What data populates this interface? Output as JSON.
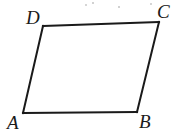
{
  "figure": {
    "background_color": "#ffffff",
    "ink_color": "#1a1a1a",
    "stroke_width": 2,
    "width": 176,
    "height": 138,
    "shape_type": "parallelogram",
    "labels": {
      "A": "A",
      "B": "B",
      "C": "C",
      "D": "D"
    },
    "vertices": [
      {
        "name": "A",
        "x": 23,
        "y": 113
      },
      {
        "name": "B",
        "x": 137,
        "y": 112
      },
      {
        "name": "C",
        "x": 159,
        "y": 22
      },
      {
        "name": "D",
        "x": 43,
        "y": 26
      }
    ],
    "edges": [
      {
        "name": "AB",
        "from": "A",
        "to": "B"
      },
      {
        "name": "BC",
        "from": "B",
        "to": "C"
      },
      {
        "name": "CD",
        "from": "C",
        "to": "D"
      },
      {
        "name": "DA",
        "from": "D",
        "to": "A"
      }
    ],
    "path_d": "M 23 113 L 137 112 L 159 22 L 43 26 Z",
    "specks": [
      {
        "x": 86,
        "y": 5,
        "r": 1.0
      },
      {
        "x": 93,
        "y": 3,
        "r": 0.8
      },
      {
        "x": 151,
        "y": 4,
        "r": 0.9
      },
      {
        "x": 119,
        "y": 7,
        "r": 0.7
      }
    ]
  }
}
